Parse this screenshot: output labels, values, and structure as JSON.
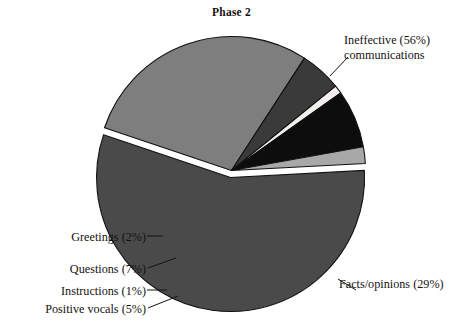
{
  "chart_data": {
    "type": "pie",
    "title": "Phase 2",
    "xlabel": "",
    "ylabel": "",
    "legend_position": "none",
    "grid": false,
    "categories": [
      "Ineffective communications",
      "Facts/opinions",
      "Positive vocals",
      "Instructions",
      "Questions",
      "Greetings"
    ],
    "values": [
      56,
      29,
      5,
      1,
      7,
      2
    ],
    "units": "percent",
    "total": 100,
    "slices": [
      {
        "key": "ineffective",
        "label_line1": "Ineffective (56%)",
        "label_line2": "communications",
        "value": 56,
        "color": "#4a4a4a",
        "exploded": true,
        "leader": "diagonal-up-right"
      },
      {
        "key": "facts",
        "label_line1": "Facts/opinions (29%)",
        "label_line2": "",
        "value": 29,
        "color": "#7e7e7e",
        "exploded": false,
        "leader": "diagonal-down-right"
      },
      {
        "key": "positive_vocals",
        "label_line1": "Positive vocals (5%)",
        "label_line2": "",
        "value": 5,
        "color": "#3a3a3a",
        "exploded": false,
        "leader": "diagonal-down-left"
      },
      {
        "key": "instructions",
        "label_line1": "Instructions (1%)",
        "label_line2": "",
        "value": 1,
        "color": "#f2f0ec",
        "exploded": false,
        "leader": "horizontal-left"
      },
      {
        "key": "questions",
        "label_line1": "Questions (7%)",
        "label_line2": "",
        "value": 7,
        "color": "#0d0d0d",
        "exploded": false,
        "leader": "diagonal-left"
      },
      {
        "key": "greetings",
        "label_line1": "Greetings (2%)",
        "label_line2": "",
        "value": 2,
        "color": "#a8a8a8",
        "exploded": false,
        "leader": "horizontal-left"
      }
    ],
    "colors": {
      "ineffective": "#4a4a4a",
      "facts": "#7e7e7e",
      "positive_vocals": "#3a3a3a",
      "instructions": "#f2f0ec",
      "questions": "#0d0d0d",
      "greetings": "#a8a8a8",
      "outline": "#111111",
      "background": "#ffffff",
      "text": "#16120f"
    }
  }
}
